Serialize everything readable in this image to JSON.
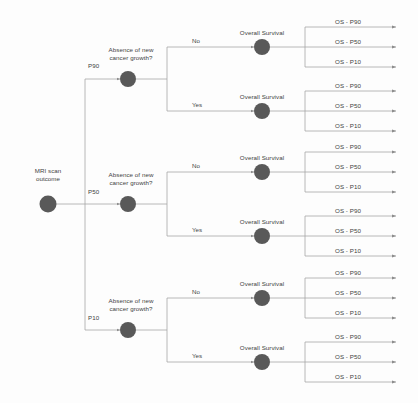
{
  "diagram": {
    "root": {
      "label_line1": "MRI scan",
      "label_line2": "outcome",
      "node_name": "root-node"
    },
    "colors": {
      "node_fill": "#595959",
      "line": "#a6a6a6",
      "text": "#3f3f3f",
      "background": "#fdfdfd"
    },
    "decision_label_line1": "Absence of new",
    "decision_label_line2": "cancer growth?",
    "survival_label": "Overall Survival",
    "answer_no": "No",
    "answer_yes": "Yes",
    "branches": [
      {
        "probability": "P90",
        "decision_label_line1": "Absence of new",
        "decision_label_line2": "cancer growth?",
        "outcomes": [
          {
            "answer": "No",
            "survival_label": "Overall Survival",
            "terminals": [
              "OS - P90",
              "OS - P50",
              "OS - P10"
            ]
          },
          {
            "answer": "Yes",
            "survival_label": "Overall Survival",
            "terminals": [
              "OS - P90",
              "OS - P50",
              "OS - P10"
            ]
          }
        ]
      },
      {
        "probability": "P50",
        "decision_label_line1": "Absence of new",
        "decision_label_line2": "cancer growth?",
        "outcomes": [
          {
            "answer": "No",
            "survival_label": "Overall Survival",
            "terminals": [
              "OS - P90",
              "OS - P50",
              "OS - P10"
            ]
          },
          {
            "answer": "Yes",
            "survival_label": "Overall Survival",
            "terminals": [
              "OS - P90",
              "OS - P50",
              "OS - P10"
            ]
          }
        ]
      },
      {
        "probability": "P10",
        "decision_label_line1": "Absence of new",
        "decision_label_line2": "cancer growth?",
        "outcomes": [
          {
            "answer": "No",
            "survival_label": "Overall Survival",
            "terminals": [
              "OS - P90",
              "OS - P50",
              "OS - P10"
            ]
          },
          {
            "answer": "Yes",
            "survival_label": "Overall Survival",
            "terminals": [
              "OS - P90",
              "OS - P50",
              "OS - P10"
            ]
          }
        ]
      }
    ]
  }
}
